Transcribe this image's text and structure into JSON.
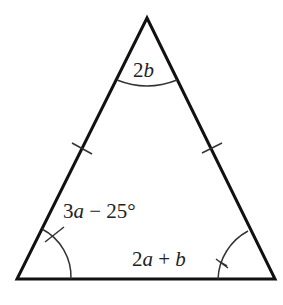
{
  "diagram": {
    "type": "isosceles-triangle",
    "vertices": {
      "apex": [
        147,
        18
      ],
      "bottom_left": [
        17,
        279
      ],
      "bottom_right": [
        275,
        279
      ]
    },
    "angles": {
      "apex": {
        "coef": "2",
        "var": "b"
      },
      "bottom_left": {
        "coef": "3",
        "var": "a",
        "rest": " − 25°"
      },
      "bottom_right": {
        "coef": "2",
        "var": "a",
        "mid": " + ",
        "var2": "b"
      }
    },
    "equal_side_marks": [
      "left",
      "right"
    ],
    "colors": {
      "line": "#111111",
      "arc": "#333333",
      "text": "#222222",
      "background": "#ffffff"
    }
  }
}
